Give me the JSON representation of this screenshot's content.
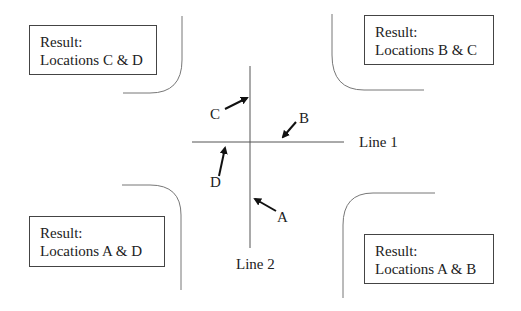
{
  "diagram": {
    "type": "intersection-sensor-locations",
    "lines": {
      "line1": "Line 1",
      "line2": "Line 2"
    },
    "locations": {
      "A": "A",
      "B": "B",
      "C": "C",
      "D": "D"
    },
    "results": {
      "top_left": {
        "title": "Result:",
        "body": "Locations C & D"
      },
      "top_right": {
        "title": "Result:",
        "body": "Locations B & C"
      },
      "bottom_left": {
        "title": "Result:",
        "body": "Locations A & D"
      },
      "bottom_right": {
        "title": "Result:",
        "body": "Locations A & B"
      }
    },
    "colors": {
      "line": "#555555",
      "arrow": "#111111",
      "curb": "#777777",
      "text": "#222222"
    }
  }
}
